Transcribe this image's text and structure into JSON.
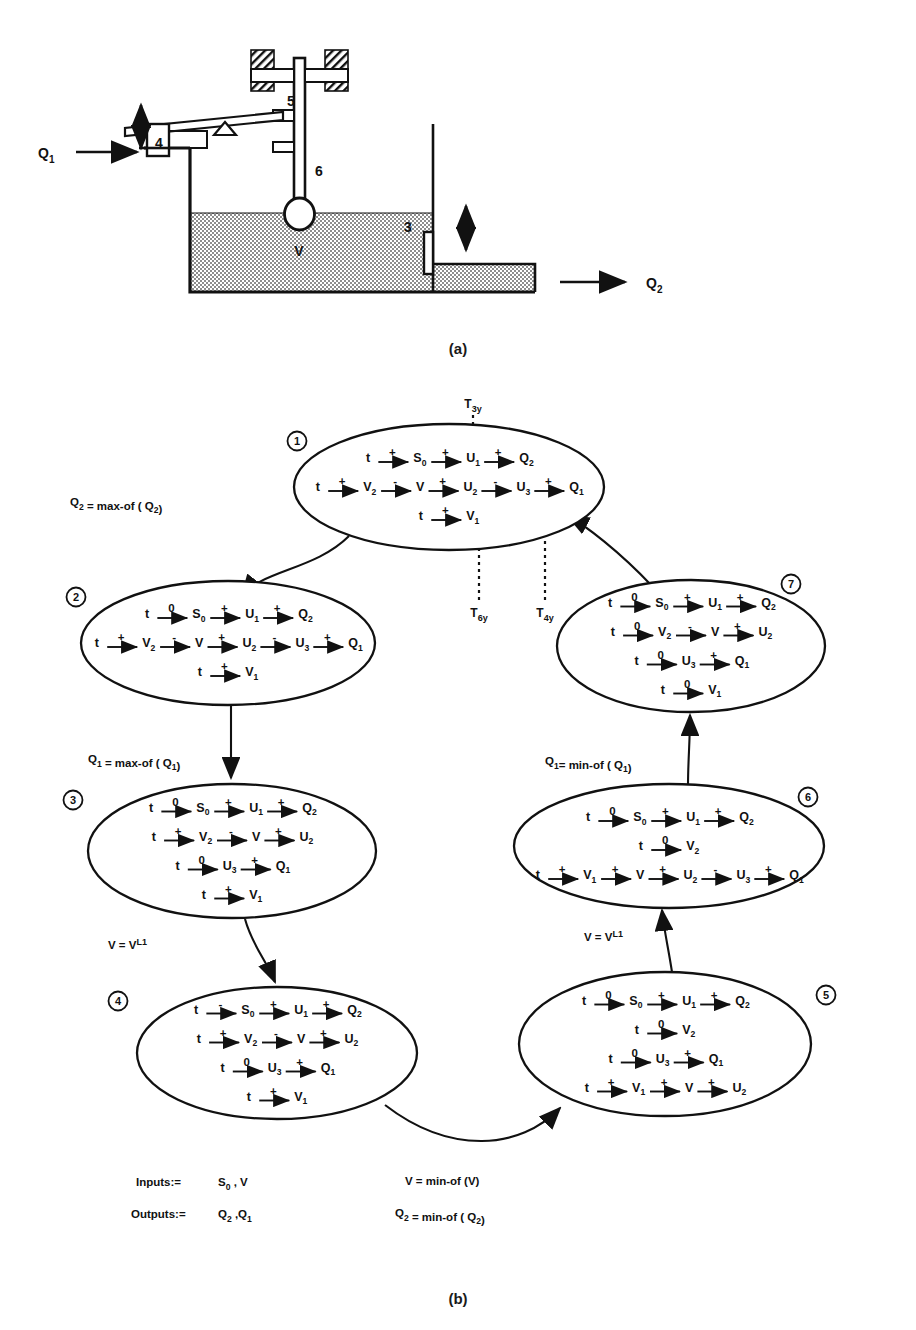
{
  "page": {
    "faded_header": "",
    "caption_a": "(a)",
    "caption_b": "(b)"
  },
  "figure_a": {
    "name": "tank-level-control-schematic",
    "inflow_label": "Q",
    "inflow_sub": "1",
    "outflow_label": "Q",
    "outflow_sub": "2",
    "volume_label": "V",
    "part_labels": [
      "3",
      "4",
      "5",
      "6"
    ],
    "part_5": "5",
    "part_4": "4",
    "part_6": "6",
    "part_3": "3"
  },
  "figure_b": {
    "name": "qualitative-state-transition-graph",
    "transition_markers": [
      {
        "id": "T3y",
        "base": "T",
        "sub": "3y"
      },
      {
        "id": "T6y",
        "base": "T",
        "sub": "6y"
      },
      {
        "id": "T4y",
        "base": "T",
        "sub": "4y"
      }
    ],
    "io": {
      "inputs_label": "Inputs:=",
      "inputs_value": "S0 , V",
      "outputs_label": "Outputs:=",
      "outputs_value": "Q2 , Q1"
    },
    "edges": [
      {
        "from": 1,
        "to": 2,
        "label": "Q2 = max-of ( Q2 )"
      },
      {
        "from": 2,
        "to": 3,
        "label": "Q1 = max-of ( Q1 )"
      },
      {
        "from": 3,
        "to": 4,
        "label": "V = V L1"
      },
      {
        "from": 4,
        "to": 5,
        "label": "V = min-of (V)  /  Q2 = min-of ( Q2 )"
      },
      {
        "from": 5,
        "to": 6,
        "label": "V = V L1"
      },
      {
        "from": 6,
        "to": 7,
        "label": "Q1 = min-of ( Q1 )"
      },
      {
        "from": 7,
        "to": 1,
        "label": ""
      }
    ],
    "nodes": [
      {
        "num": "1",
        "rows": [
          {
            "chain": [
              {
                "v": "t",
                "sub": ""
              },
              {
                "s": "+"
              },
              {
                "v": "S",
                "sub": "0"
              },
              {
                "s": "+"
              },
              {
                "v": "U",
                "sub": "1"
              },
              {
                "s": "+"
              },
              {
                "v": "Q",
                "sub": "2"
              }
            ]
          },
          {
            "chain": [
              {
                "v": "t",
                "sub": ""
              },
              {
                "s": "+"
              },
              {
                "v": "V",
                "sub": "2"
              },
              {
                "s": "-"
              },
              {
                "v": "V",
                "sub": ""
              },
              {
                "s": "+"
              },
              {
                "v": "U",
                "sub": "2"
              },
              {
                "s": "-"
              },
              {
                "v": "U",
                "sub": "3"
              },
              {
                "s": "+"
              },
              {
                "v": "Q",
                "sub": "1"
              }
            ]
          },
          {
            "chain": [
              {
                "v": "t",
                "sub": ""
              },
              {
                "s": "+"
              },
              {
                "v": "V",
                "sub": "1"
              }
            ]
          }
        ]
      },
      {
        "num": "2",
        "rows": [
          {
            "chain": [
              {
                "v": "t",
                "sub": ""
              },
              {
                "s": "0"
              },
              {
                "v": "S",
                "sub": "0"
              },
              {
                "s": "+"
              },
              {
                "v": "U",
                "sub": "1"
              },
              {
                "s": "+"
              },
              {
                "v": "Q",
                "sub": "2"
              }
            ]
          },
          {
            "chain": [
              {
                "v": "t",
                "sub": ""
              },
              {
                "s": "+"
              },
              {
                "v": "V",
                "sub": "2"
              },
              {
                "s": "-"
              },
              {
                "v": "V",
                "sub": ""
              },
              {
                "s": "+"
              },
              {
                "v": "U",
                "sub": "2"
              },
              {
                "s": "-"
              },
              {
                "v": "U",
                "sub": "3"
              },
              {
                "s": "+"
              },
              {
                "v": "Q",
                "sub": "1"
              }
            ]
          },
          {
            "chain": [
              {
                "v": "t",
                "sub": ""
              },
              {
                "s": "+"
              },
              {
                "v": "V",
                "sub": "1"
              }
            ]
          }
        ]
      },
      {
        "num": "3",
        "rows": [
          {
            "chain": [
              {
                "v": "t",
                "sub": ""
              },
              {
                "s": "0"
              },
              {
                "v": "S",
                "sub": "0"
              },
              {
                "s": "+"
              },
              {
                "v": "U",
                "sub": "1"
              },
              {
                "s": "+"
              },
              {
                "v": "Q",
                "sub": "2"
              }
            ]
          },
          {
            "chain": [
              {
                "v": "t",
                "sub": ""
              },
              {
                "s": "+"
              },
              {
                "v": "V",
                "sub": "2"
              },
              {
                "s": "-"
              },
              {
                "v": "V",
                "sub": ""
              },
              {
                "s": "+"
              },
              {
                "v": "U",
                "sub": "2"
              }
            ]
          },
          {
            "chain": [
              {
                "v": "t",
                "sub": ""
              },
              {
                "s": "0"
              },
              {
                "v": "U",
                "sub": "3"
              },
              {
                "s": "+"
              },
              {
                "v": "Q",
                "sub": "1"
              }
            ]
          },
          {
            "chain": [
              {
                "v": "t",
                "sub": ""
              },
              {
                "s": "+"
              },
              {
                "v": "V",
                "sub": "1"
              }
            ]
          }
        ]
      },
      {
        "num": "4",
        "rows": [
          {
            "chain": [
              {
                "v": "t",
                "sub": ""
              },
              {
                "s": "-"
              },
              {
                "v": "S",
                "sub": "0"
              },
              {
                "s": "+"
              },
              {
                "v": "U",
                "sub": "1"
              },
              {
                "s": "+"
              },
              {
                "v": "Q",
                "sub": "2"
              }
            ]
          },
          {
            "chain": [
              {
                "v": "t",
                "sub": ""
              },
              {
                "s": "+"
              },
              {
                "v": "V",
                "sub": "2"
              },
              {
                "s": "-"
              },
              {
                "v": "V",
                "sub": ""
              },
              {
                "s": "+"
              },
              {
                "v": "U",
                "sub": "2"
              }
            ]
          },
          {
            "chain": [
              {
                "v": "t",
                "sub": ""
              },
              {
                "s": "0"
              },
              {
                "v": "U",
                "sub": "3"
              },
              {
                "s": "+"
              },
              {
                "v": "Q",
                "sub": "1"
              }
            ]
          },
          {
            "chain": [
              {
                "v": "t",
                "sub": ""
              },
              {
                "s": "+"
              },
              {
                "v": "V",
                "sub": "1"
              }
            ]
          }
        ]
      },
      {
        "num": "5",
        "rows": [
          {
            "chain": [
              {
                "v": "t",
                "sub": ""
              },
              {
                "s": "0"
              },
              {
                "v": "S",
                "sub": "0"
              },
              {
                "s": "+"
              },
              {
                "v": "U",
                "sub": "1"
              },
              {
                "s": "+"
              },
              {
                "v": "Q",
                "sub": "2"
              }
            ]
          },
          {
            "chain": [
              {
                "v": "t",
                "sub": ""
              },
              {
                "s": "0"
              },
              {
                "v": "V",
                "sub": "2"
              }
            ]
          },
          {
            "chain": [
              {
                "v": "t",
                "sub": ""
              },
              {
                "s": "0"
              },
              {
                "v": "U",
                "sub": "3"
              },
              {
                "s": "+"
              },
              {
                "v": "Q",
                "sub": "1"
              }
            ]
          },
          {
            "chain": [
              {
                "v": "t",
                "sub": ""
              },
              {
                "s": "+"
              },
              {
                "v": "V",
                "sub": "1"
              },
              {
                "s": "+"
              },
              {
                "v": "V",
                "sub": ""
              },
              {
                "s": "+"
              },
              {
                "v": "U",
                "sub": "2"
              }
            ]
          }
        ]
      },
      {
        "num": "6",
        "rows": [
          {
            "chain": [
              {
                "v": "t",
                "sub": ""
              },
              {
                "s": "0"
              },
              {
                "v": "S",
                "sub": "0"
              },
              {
                "s": "+"
              },
              {
                "v": "U",
                "sub": "1"
              },
              {
                "s": "+"
              },
              {
                "v": "Q",
                "sub": "2"
              }
            ]
          },
          {
            "chain": [
              {
                "v": "t",
                "sub": ""
              },
              {
                "s": "0"
              },
              {
                "v": "V",
                "sub": "2"
              }
            ]
          },
          {
            "chain": [
              {
                "v": "t",
                "sub": ""
              },
              {
                "s": "+"
              },
              {
                "v": "V",
                "sub": "1"
              },
              {
                "s": "+"
              },
              {
                "v": "V",
                "sub": ""
              },
              {
                "s": "+"
              },
              {
                "v": "U",
                "sub": "2"
              },
              {
                "s": "-"
              },
              {
                "v": "U",
                "sub": "3"
              },
              {
                "s": "+"
              },
              {
                "v": "Q",
                "sub": "1"
              }
            ]
          }
        ]
      },
      {
        "num": "7",
        "rows": [
          {
            "chain": [
              {
                "v": "t",
                "sub": ""
              },
              {
                "s": "0"
              },
              {
                "v": "S",
                "sub": "0"
              },
              {
                "s": "+"
              },
              {
                "v": "U",
                "sub": "1"
              },
              {
                "s": "+"
              },
              {
                "v": "Q",
                "sub": "2"
              }
            ]
          },
          {
            "chain": [
              {
                "v": "t",
                "sub": ""
              },
              {
                "s": "0"
              },
              {
                "v": "V",
                "sub": "2"
              },
              {
                "s": "-"
              },
              {
                "v": "V",
                "sub": ""
              },
              {
                "s": "+"
              },
              {
                "v": "U",
                "sub": "2"
              }
            ]
          },
          {
            "chain": [
              {
                "v": "t",
                "sub": ""
              },
              {
                "s": "0"
              },
              {
                "v": "U",
                "sub": "3"
              },
              {
                "s": "+"
              },
              {
                "v": "Q",
                "sub": "1"
              }
            ]
          },
          {
            "chain": [
              {
                "v": "t",
                "sub": ""
              },
              {
                "s": "0"
              },
              {
                "v": "V",
                "sub": "1"
              }
            ]
          }
        ]
      }
    ]
  },
  "colors": {
    "ink": "#111111",
    "paper": "#ffffff",
    "fluid": "#8a8a8a"
  }
}
